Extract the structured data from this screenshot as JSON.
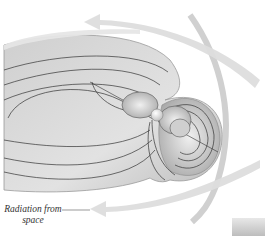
{
  "diagram": {
    "labels": {
      "radiation": "Radiation from",
      "radiation_line2": "space"
    },
    "colors": {
      "background": "#ffffff",
      "magnetosphere_fill": "#d6d6d6",
      "field_line": "#333333",
      "arrow": "#dcdcdc",
      "earth": "#f2f2f2"
    }
  }
}
